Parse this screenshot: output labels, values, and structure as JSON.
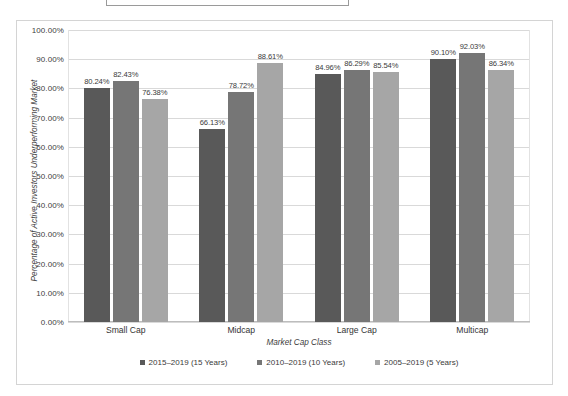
{
  "title_box": {
    "text": ""
  },
  "chart_data": {
    "type": "bar",
    "title": "",
    "xlabel": "Market Cap Class",
    "ylabel": "Percentage of Active Investors Underperforming Market",
    "categories": [
      "Small Cap",
      "Midcap",
      "Large Cap",
      "Multicap"
    ],
    "series": [
      {
        "name": "2015–2019 (15 Years)",
        "color": "#595959",
        "values": [
          80.24,
          66.13,
          84.96,
          90.1
        ],
        "labels": [
          "80.24%",
          "66.13%",
          "84.96%",
          "90.10%"
        ]
      },
      {
        "name": "2010–2019 (10 Years)",
        "color": "#767676",
        "values": [
          82.43,
          78.72,
          86.29,
          92.03
        ],
        "labels": [
          "82.43%",
          "78.72%",
          "86.29%",
          "92.03%"
        ]
      },
      {
        "name": "2005–2019 (5 Years)",
        "color": "#a6a6a6",
        "values": [
          76.38,
          88.61,
          85.54,
          86.34
        ],
        "labels": [
          "76.38%",
          "88.61%",
          "85.54%",
          "86.34%"
        ]
      }
    ],
    "ylim": [
      0,
      100
    ],
    "ytick_values": [
      0,
      10,
      20,
      30,
      40,
      50,
      60,
      70,
      80,
      90,
      100
    ],
    "ytick_labels": [
      "0.00%",
      "10.00%",
      "20.00%",
      "30.00%",
      "40.00%",
      "50.00%",
      "60.00%",
      "70.00%",
      "80.00%",
      "90.00%",
      "100.00%"
    ],
    "grid": true,
    "legend_position": "bottom"
  }
}
